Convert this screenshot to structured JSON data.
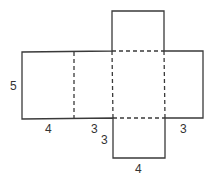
{
  "diagram": {
    "type": "rectangular-prism-net",
    "labels": {
      "left_height": "5",
      "left_width": "4",
      "middle_left_width": "3",
      "bottom_square_side": "3",
      "bottom_square_width": "4",
      "right_width": "3"
    },
    "colors": {
      "line": "#3a3a3a",
      "text": "#333333",
      "background": "#ffffff"
    }
  }
}
